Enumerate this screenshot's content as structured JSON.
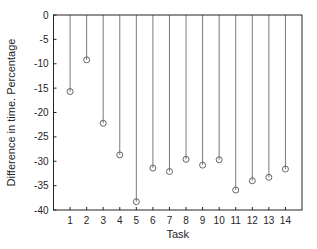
{
  "chart_data": {
    "type": "stem",
    "title": "",
    "xlabel": "Task",
    "ylabel": "Difference in time. Percentage",
    "x": [
      1,
      2,
      3,
      4,
      5,
      6,
      7,
      8,
      9,
      10,
      11,
      12,
      13,
      14
    ],
    "categories": [
      "1",
      "2",
      "3",
      "4",
      "5",
      "6",
      "7",
      "8",
      "9",
      "10",
      "11",
      "12",
      "13",
      "14"
    ],
    "values": [
      -15.7,
      -9.2,
      -22.2,
      -28.7,
      -38.3,
      -31.4,
      -32.1,
      -29.6,
      -30.8,
      -29.7,
      -35.9,
      -34.0,
      -33.3,
      -31.6
    ],
    "xlim": [
      0,
      15
    ],
    "ylim": [
      -40,
      0
    ],
    "yticks": [
      0,
      -5,
      -10,
      -15,
      -20,
      -25,
      -30,
      -35,
      -40
    ],
    "yticklabels": [
      "0",
      "-5",
      "-10",
      "-15",
      "-20",
      "-25",
      "-30",
      "-35",
      "-40"
    ],
    "xticks": [
      1,
      2,
      3,
      4,
      5,
      6,
      7,
      8,
      9,
      10,
      11,
      12,
      13,
      14
    ],
    "grid": false,
    "legend": null,
    "marker": "circle-open",
    "colors": {
      "stem": "#7a7a7a",
      "marker": "#555555",
      "axis": "#262626"
    }
  }
}
